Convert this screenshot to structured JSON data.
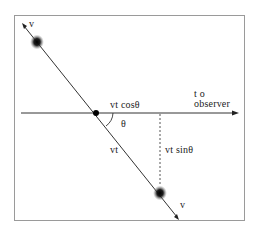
{
  "diagram": {
    "labels": {
      "v_top": "v",
      "v_bottom": "v",
      "vt_cos": "vt cosθ",
      "to": "t o",
      "observer": "observer",
      "theta": "θ",
      "vt": "vt",
      "vt_sin": "vt sinθ"
    },
    "colors": {
      "line": "#333333",
      "frame": "#999999",
      "blob": "#111111"
    }
  }
}
